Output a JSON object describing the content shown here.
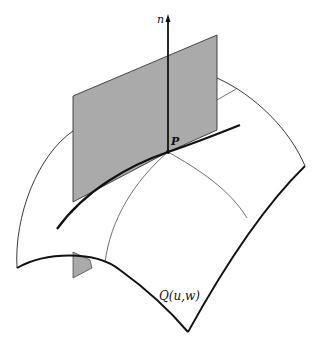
{
  "figure": {
    "normal_label": "n",
    "point_label": "P",
    "surface_label": "Q(u,w)",
    "plane_color": "#aaaaaa",
    "line_color": "#111111"
  }
}
